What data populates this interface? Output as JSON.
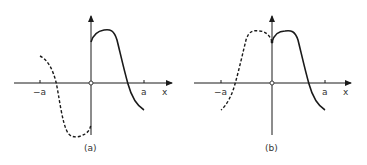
{
  "figures": [
    {
      "id": "a",
      "caption": "(a)",
      "tick_left": "−a",
      "tick_right": "a",
      "axis_label": "x",
      "description": "Odd extension: solid curve on 0<x<a, dashed negated mirror on −a<x<0"
    },
    {
      "id": "b",
      "caption": "(b)",
      "tick_left": "−a",
      "tick_right": "a",
      "axis_label": "x",
      "description": "Even extension: solid curve on 0<x<a, dashed mirror on −a<x<0"
    }
  ],
  "colors": {
    "stroke": "#1a1a1a",
    "text": "#333333",
    "background": "#ffffff"
  }
}
